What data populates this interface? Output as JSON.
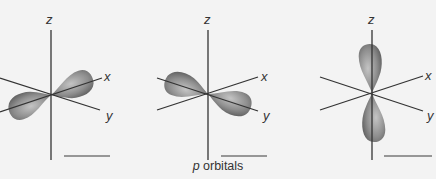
{
  "caption": {
    "italic": "p",
    "text": " orbitals"
  },
  "panels": [
    {
      "name": "px",
      "axes": [
        "z",
        "x",
        "y"
      ]
    },
    {
      "name": "py",
      "axes": [
        "z",
        "x",
        "y"
      ]
    },
    {
      "name": "pz",
      "axes": [
        "z",
        "x",
        "y"
      ]
    }
  ],
  "colors": {
    "background": "#f3f3f3",
    "axis": "#333333",
    "lobe_light": "#b8b8b8",
    "lobe_dark": "#6a6a6a",
    "scale_bar": "#777777"
  }
}
